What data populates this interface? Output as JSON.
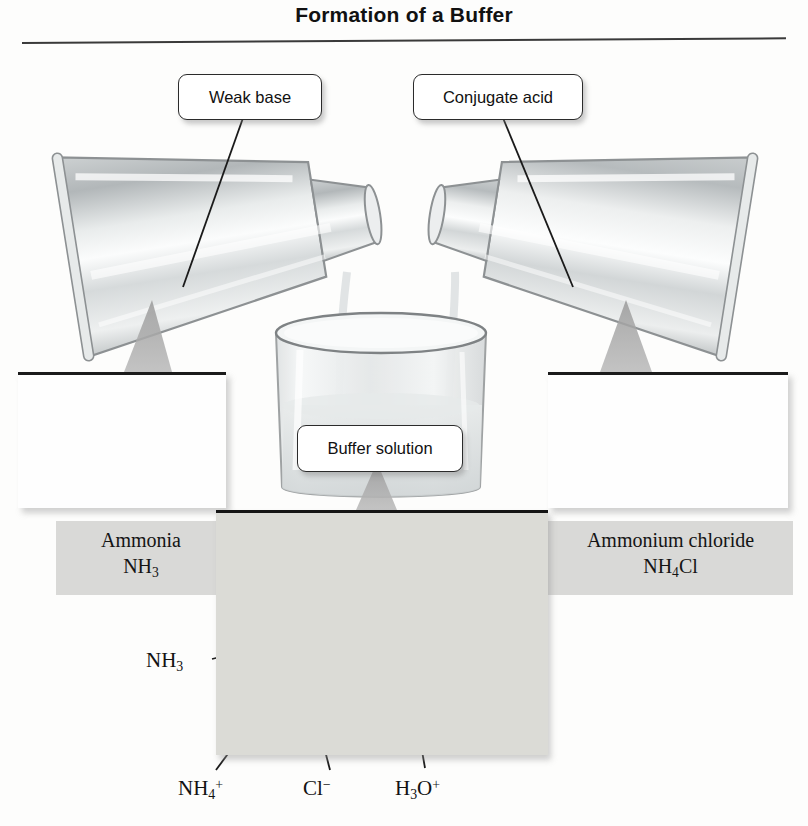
{
  "figure": {
    "title": "Formation of a Buffer",
    "domain": "chemistry-diagram"
  },
  "callouts": [
    {
      "id": "weak-base",
      "label": "Weak base"
    },
    {
      "id": "conjugate-acid",
      "label": "Conjugate acid"
    },
    {
      "id": "buffer",
      "label": "Buffer solution"
    }
  ],
  "insets": [
    {
      "id": "ammonia",
      "caption_name": "Ammonia",
      "caption_formula_base": "NH",
      "caption_formula_sub": "3",
      "model": "space-filling NH3 molecule",
      "charge_symbol": ""
    },
    {
      "id": "ammonium-chloride",
      "caption_name": "Ammonium chloride",
      "caption_formula_base_1": "NH",
      "caption_formula_sub": "4",
      "caption_formula_base_2": "Cl",
      "model": "space-filling NH4+ cation and Cl- anion",
      "cation_charge": "+",
      "anion_charge": "−"
    }
  ],
  "solution_panel": {
    "title": "buffer solution molecular view",
    "species": [
      {
        "id": "nh3",
        "base": "NH",
        "sub": "3",
        "sup": "",
        "name": "ammonia"
      },
      {
        "id": "nh4",
        "base": "NH",
        "sub": "4",
        "sup": "+",
        "name": "ammonium ion"
      },
      {
        "id": "cl",
        "base": "Cl",
        "sub": "",
        "sup": "−",
        "name": "chloride ion"
      },
      {
        "id": "h3o",
        "base": "H",
        "sub": "3",
        "sup": "+",
        "name": "hydronium ion",
        "mid": "O"
      }
    ]
  },
  "colors": {
    "title_text": "#111111",
    "rule": "#3a3a3a",
    "callout_border": "#2b2b2b",
    "caption_band": "#d9d9d7",
    "panel_background": "#dbdbd6",
    "chloride_sphere": "#6e6e6e",
    "nitrogen_sphere": "#7a7a7a",
    "hydrogen_sphere": "#e8e8e8",
    "glass": "#b9bcbd"
  },
  "apparatus": {
    "left_flask": "Erlenmeyer flask tilted right, pouring",
    "right_flask": "Erlenmeyer flask tilted left, pouring",
    "beaker": "beaker receiving both streams"
  }
}
